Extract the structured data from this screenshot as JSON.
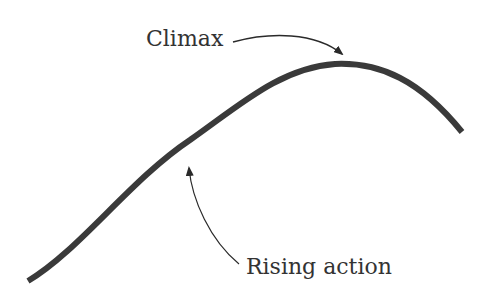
{
  "diagram": {
    "type": "story-arc",
    "labels": {
      "climax": "Climax",
      "rising_action": "Rising action"
    },
    "colors": {
      "curve": "#3a3a3a",
      "arrow": "#2a2a2a",
      "text": "#333333",
      "background": "#ffffff"
    }
  }
}
